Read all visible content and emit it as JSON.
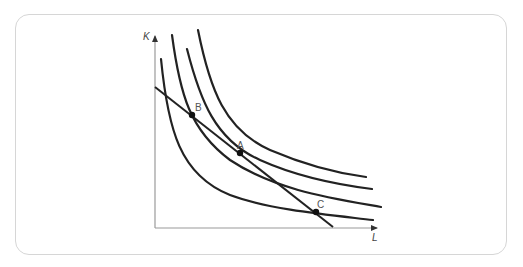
{
  "diagram": {
    "type": "isoquant-isocost",
    "axes": {
      "y_label": "K",
      "x_label": "L"
    },
    "points": [
      {
        "id": "B",
        "label": "B"
      },
      {
        "id": "A",
        "label": "A"
      },
      {
        "id": "C",
        "label": "C"
      }
    ],
    "curves": [
      {
        "name": "isoquant-1"
      },
      {
        "name": "isoquant-2"
      },
      {
        "name": "isoquant-3"
      },
      {
        "name": "isoquant-4"
      }
    ],
    "lines": [
      {
        "name": "isocost-line"
      }
    ],
    "colors": {
      "curve": "#222222",
      "axis": "#9a9a9a",
      "border": "#d6d6d6",
      "label": "#555555"
    }
  }
}
